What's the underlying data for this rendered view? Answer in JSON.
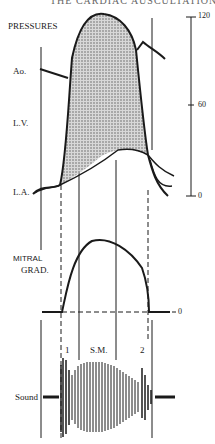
{
  "header": {
    "text": "THE CARDIAC AUSCULTATION"
  },
  "panels": {
    "pressures": {
      "title": "PRESSURES",
      "labels": {
        "aorta": "Ao.",
        "left_ventricle": "L.V.",
        "left_atrium": "L.A."
      },
      "scale_ticks": [
        "120",
        "60",
        "0"
      ]
    },
    "mitral_gradient": {
      "title_line1": "MITRAL",
      "title_line2": "GRAD.",
      "zero_tick": "0"
    },
    "sound": {
      "label": "Sound",
      "first_sound": "1",
      "murmur": "S.M.",
      "second_sound": "2"
    }
  },
  "colors": {
    "ink": "#1a1a1a",
    "shade": "#b5b5b5"
  }
}
